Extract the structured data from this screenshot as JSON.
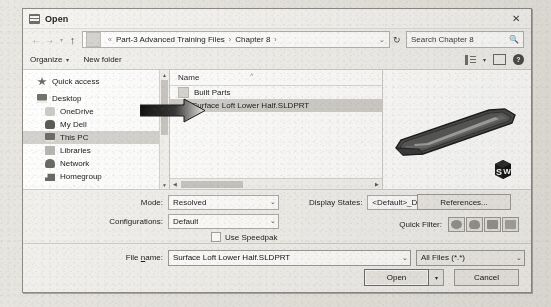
{
  "window": {
    "title": "Open",
    "icon": "folder-window-icon",
    "close_label": "✕"
  },
  "address": {
    "back_icon": "back-arrow-icon",
    "forward_icon": "forward-arrow-icon",
    "history_icon": "chevron-down-icon",
    "up_icon": "up-arrow-icon",
    "prefix": "«",
    "crumbs": [
      "Part-3 Advanced Training Files",
      "Chapter 8"
    ],
    "crumb_separator": "›",
    "dropdown_icon": "⌄",
    "refresh_icon": "↻",
    "search_placeholder": "Search Chapter 8",
    "search_icon": "search-icon"
  },
  "toolbar": {
    "organize": "Organize",
    "organize_caret": "▾",
    "new_folder": "New folder",
    "view_icon": "view-layout-icon",
    "view_caret": "▾",
    "pane_icon": "preview-pane-icon",
    "help_icon": "?"
  },
  "navpane": {
    "items": [
      {
        "label": "Quick access",
        "icon": "star-icon",
        "indent": false,
        "selected": false
      },
      {
        "label": "Desktop",
        "icon": "desktop-icon",
        "indent": false,
        "selected": false
      },
      {
        "label": "OneDrive",
        "icon": "cloud-icon",
        "indent": true,
        "selected": false
      },
      {
        "label": "My Dell",
        "icon": "user-icon",
        "indent": true,
        "selected": false
      },
      {
        "label": "This PC",
        "icon": "computer-icon",
        "indent": true,
        "selected": true
      },
      {
        "label": "Libraries",
        "icon": "library-icon",
        "indent": true,
        "selected": false
      },
      {
        "label": "Network",
        "icon": "network-icon",
        "indent": true,
        "selected": false
      },
      {
        "label": "Homegroup",
        "icon": "homegroup-icon",
        "indent": true,
        "selected": false
      }
    ],
    "scroll_up_icon": "▲",
    "scroll_down_icon": "▼"
  },
  "filelist": {
    "column_header": "Name",
    "sort_indicator": "˄",
    "rows": [
      {
        "name": "Built Parts",
        "icon": "folder-icon",
        "selected": false
      },
      {
        "name": "Surface Loft Lower Half.SLDPRT",
        "icon": "part-file-icon",
        "selected": true
      }
    ],
    "hscroll_left_icon": "◀",
    "hscroll_right_icon": "▶",
    "hscroll_caret_icon": "▾"
  },
  "preview": {
    "model_name": "surface-loft-lower-half-3d-preview",
    "logo": "solidworks-logo",
    "logo_letters": [
      "S",
      "W"
    ]
  },
  "options": {
    "mode_label": "Mode:",
    "mode_value": "Resolved",
    "configurations_label": "Configurations:",
    "configurations_value": "Default",
    "display_states_label": "Display States:",
    "display_states_value": "<Default>_Display St",
    "use_speedpak_label": "Use Speedpak",
    "use_speedpak_checked": false,
    "references_label": "References...",
    "quick_filter_label": "Quick Filter:",
    "quick_filter_buttons": [
      "filter-parts-icon",
      "filter-assemblies-icon",
      "filter-drawings-icon",
      "filter-topdown-icon"
    ],
    "dropdown_icon": "⌄"
  },
  "bottom": {
    "file_name_label_pre": "File ",
    "file_name_label_underline": "n",
    "file_name_label_post": "ame:",
    "file_name_value": "Surface Loft Lower Half.SLDPRT",
    "file_type_value": "All Files (*.*)",
    "open_label": "Open",
    "open_split_icon": "▾",
    "cancel_label": "Cancel",
    "dropdown_icon": "⌄"
  },
  "annotation": {
    "arrow": "pointer-arrow-annotation"
  },
  "colors": {
    "dialog_bg": "#f3f2ef",
    "page_bg": "#e9e7e2",
    "selection": "#d2d0cc",
    "border": "#8e8c88"
  }
}
